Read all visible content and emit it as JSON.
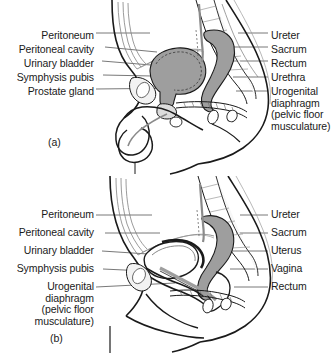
{
  "document": {
    "type": "anatomy-diagram",
    "title": "Sagittal sections of the male and female pelvis",
    "panels": [
      {
        "id": "a",
        "caption": "(a)",
        "subject": "male pelvis sagittal section",
        "left_labels": [
          {
            "text": "Peritoneum",
            "y": 37
          },
          {
            "text": "Peritoneal cavity",
            "y": 51
          },
          {
            "text": "Urinary bladder",
            "y": 65
          },
          {
            "text": "Symphysis pubis",
            "y": 79
          },
          {
            "text": "Prostate gland",
            "y": 93
          }
        ],
        "right_labels": [
          {
            "text": "Ureter",
            "y": 37
          },
          {
            "text": "Sacrum",
            "y": 51
          },
          {
            "text": "Rectum",
            "y": 65
          },
          {
            "text": "Urethra",
            "y": 79
          },
          {
            "text": "Urogenital\ndiaphragm\n(pelvic floor\nmusculature)",
            "y": 93
          }
        ]
      },
      {
        "id": "b",
        "caption": "(b)",
        "subject": "female pelvis sagittal section",
        "left_labels": [
          {
            "text": "Peritoneum",
            "y": 215
          },
          {
            "text": "Peritoneal cavity",
            "y": 233
          },
          {
            "text": "Urinary bladder",
            "y": 251
          },
          {
            "text": "Symphysis pubis",
            "y": 269
          },
          {
            "text": "Urogenital\ndiaphragm\n(pelvic floor\nmusculature)",
            "y": 287
          }
        ],
        "right_labels": [
          {
            "text": "Ureter",
            "y": 215
          },
          {
            "text": "Sacrum",
            "y": 233
          },
          {
            "text": "Uterus",
            "y": 251
          },
          {
            "text": "Vagina",
            "y": 269
          },
          {
            "text": "Rectum",
            "y": 287
          }
        ]
      }
    ]
  },
  "colors": {
    "background": "#ffffff",
    "line": "#1a1a1a",
    "leader": "#555555",
    "organ_fill": "#9e9e9e",
    "organ_fill_light": "#c9c9c9",
    "bone_fill": "#f2f2f2",
    "text": "#1a1a1a"
  }
}
